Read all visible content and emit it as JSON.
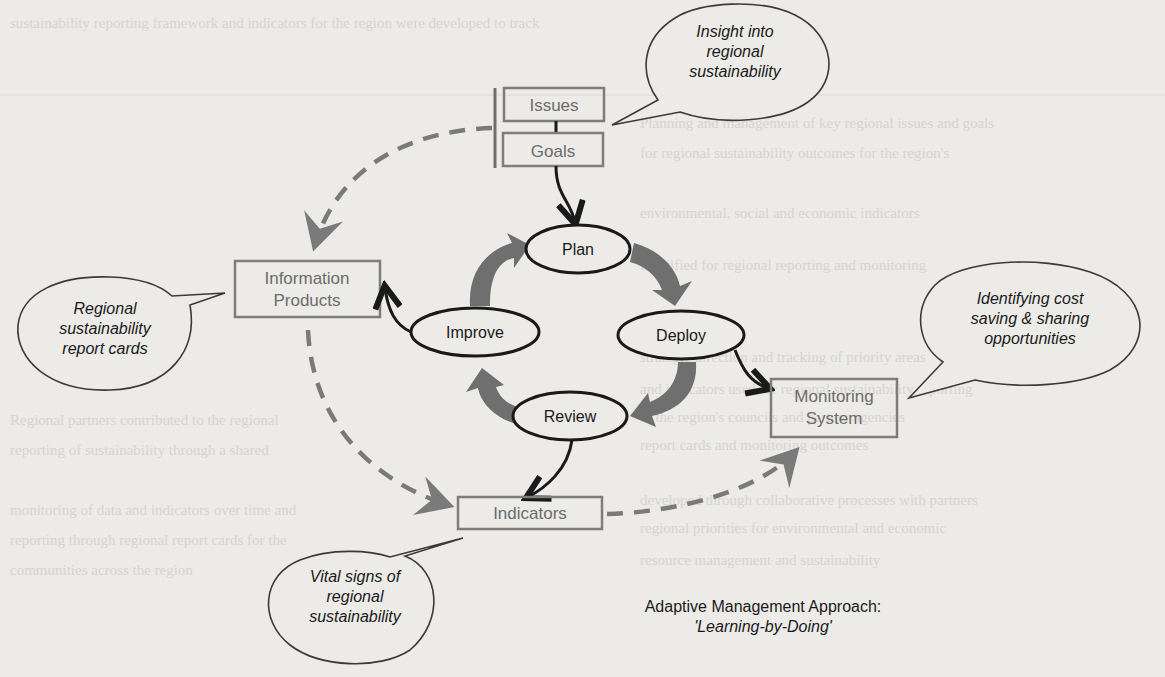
{
  "diagram": {
    "caption": {
      "title": "Adaptive Management Approach:",
      "subtitle": "'Learning-by-Doing'"
    },
    "boxes": {
      "issues": "Issues",
      "goals": "Goals",
      "information_products": [
        "Information",
        "Products"
      ],
      "monitoring_system": [
        "Monitoring",
        "System"
      ],
      "indicators": "Indicators"
    },
    "cycle_nodes": {
      "plan": "Plan",
      "deploy": "Deploy",
      "review": "Review",
      "improve": "Improve"
    },
    "bubbles": {
      "insight": [
        "Insight into",
        "regional",
        "sustainability"
      ],
      "report_cards": [
        "Regional",
        "sustainability",
        "report cards"
      ],
      "cost_saving": [
        "Identifying cost",
        "saving & sharing",
        "opportunities"
      ],
      "vital_signs": [
        "Vital signs of",
        "regional",
        "sustainability"
      ]
    },
    "colors": {
      "page_background": "#ecebe8",
      "cycle_arrow_fill": "#6f6f6f",
      "dashed_arrow": "#7a7a7a",
      "box_border": "#7d7d7d",
      "ink": "#1a1a1a"
    }
  }
}
